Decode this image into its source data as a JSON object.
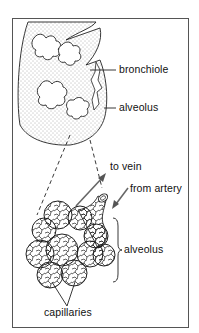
{
  "figure": {
    "upper_panel": {
      "labels": {
        "bronchiole": "bronchiole",
        "alveolus": "alveolus"
      }
    },
    "lower_panel": {
      "labels": {
        "to_vein": "to vein",
        "from_artery": "from artery",
        "alveolus": "alveolus",
        "capillaries": "capillaries"
      }
    },
    "colors": {
      "line": "#222222",
      "stipple": "#555555",
      "frame": "#555555",
      "arrow": "#666666"
    }
  }
}
